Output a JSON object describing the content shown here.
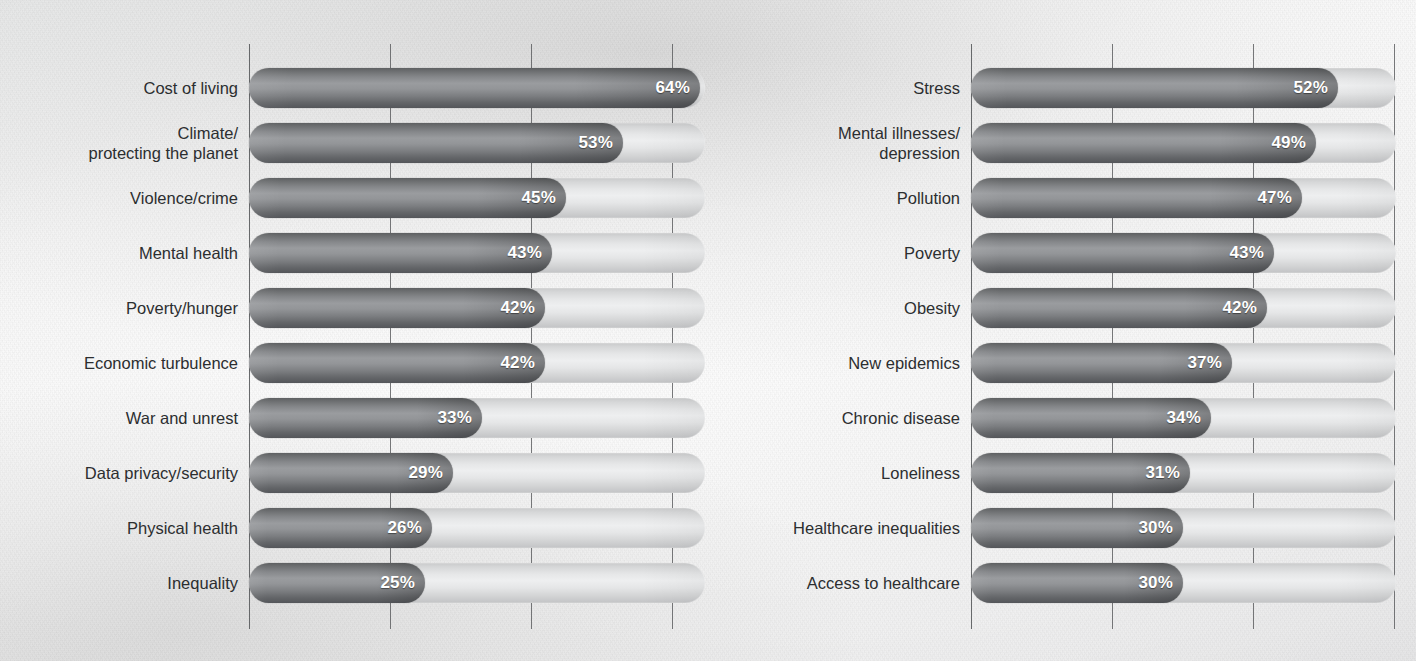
{
  "background": {
    "paper_color": "#f4f4f4",
    "ink_color": "#2c2e30",
    "bar_dark": "#7c7e81",
    "bar_track": "#e2e3e4"
  },
  "cropped_top_text": "",
  "chart_data": [
    {
      "id": "left",
      "type": "bar",
      "orientation": "horizontal",
      "title": "",
      "xlabel": "",
      "ylabel": "",
      "xlim": [
        0,
        80
      ],
      "gridlines": [
        20,
        40,
        60
      ],
      "grid": true,
      "legend": "none",
      "value_suffix": "%",
      "categories": [
        "Cost of living",
        "Climate/\nprotecting the planet",
        "Violence/crime",
        "Mental health",
        "Poverty/hunger",
        "Economic turbulence",
        "War and unrest",
        "Data privacy/security",
        "Physical health",
        "Inequality"
      ],
      "values": [
        64,
        53,
        45,
        43,
        42,
        42,
        33,
        29,
        26,
        25
      ],
      "labels": [
        "64%",
        "53%",
        "45%",
        "43%",
        "42%",
        "42%",
        "33%",
        "29%",
        "26%",
        "25%"
      ]
    },
    {
      "id": "right",
      "type": "bar",
      "orientation": "horizontal",
      "title": "",
      "xlabel": "",
      "ylabel": "",
      "xlim": [
        0,
        80
      ],
      "gridlines": [
        20,
        40,
        60
      ],
      "grid": true,
      "legend": "none",
      "value_suffix": "%",
      "categories": [
        "Stress",
        "Mental illnesses/\ndepression",
        "Pollution",
        "Poverty",
        "Obesity",
        "New epidemics",
        "Chronic disease",
        "Loneliness",
        "Healthcare inequalities",
        "Access to healthcare"
      ],
      "values": [
        52,
        49,
        47,
        43,
        42,
        37,
        34,
        31,
        30,
        30
      ],
      "labels": [
        "52%",
        "49%",
        "47%",
        "43%",
        "42%",
        "37%",
        "34%",
        "31%",
        "30%",
        "30%"
      ]
    }
  ]
}
